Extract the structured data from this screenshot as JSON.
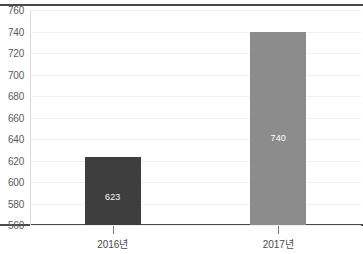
{
  "chart_data": {
    "type": "bar",
    "title": "",
    "xlabel": "",
    "ylabel": "",
    "categories": [
      "2016년",
      "2017년"
    ],
    "values": [
      623,
      740
    ],
    "value_labels": [
      "623",
      "740"
    ],
    "series": [
      {
        "name": "",
        "values": [
          623,
          740
        ]
      }
    ],
    "ylim": [
      560,
      760
    ],
    "y_ticks": [
      560,
      580,
      600,
      620,
      640,
      660,
      680,
      700,
      720,
      740,
      760
    ],
    "y_tick_labels": [
      "560",
      "580",
      "600",
      "620",
      "640",
      "660",
      "680",
      "700",
      "720",
      "740",
      "760"
    ],
    "grid": true,
    "legend": false,
    "legend_position": "none",
    "bar_colors": [
      "#3e3e3e",
      "#8c8c8c"
    ],
    "data_label_color": "#ffffff",
    "gridline_color": "#f0f0f0",
    "axis_color": "#4a4a4a",
    "tick_label_color": "#5a5a5a",
    "background_color": "#ffffff"
  },
  "axis": {
    "y_labels": [
      "760",
      "740",
      "720",
      "700",
      "680",
      "660",
      "640",
      "620",
      "600",
      "580",
      "560"
    ],
    "x_labels": [
      "2016년",
      "2017년"
    ]
  },
  "bars": [
    {
      "label": "2016년",
      "value_text": "623"
    },
    {
      "label": "2017년",
      "value_text": "740"
    }
  ]
}
